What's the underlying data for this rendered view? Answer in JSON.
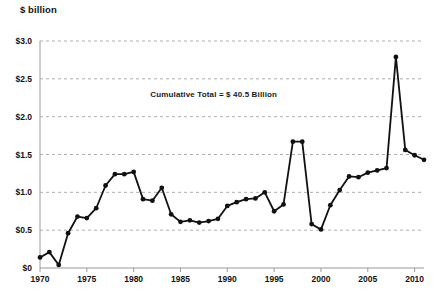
{
  "chart_data": {
    "type": "line",
    "title": "",
    "ylabel": "$ billion",
    "xlabel": "",
    "ylim": [
      0,
      3.0
    ],
    "xlim": [
      1970,
      2011
    ],
    "grid": true,
    "legend": "none",
    "y_ticks": [
      0,
      0.5,
      1.0,
      1.5,
      2.0,
      2.5,
      3.0
    ],
    "y_tick_labels": [
      "$0",
      "$0.5",
      "$1.0",
      "$1.5",
      "$2.0",
      "$2.5",
      "$3.0"
    ],
    "x_ticks": [
      1970,
      1975,
      1980,
      1985,
      1990,
      1995,
      2000,
      2005,
      2010
    ],
    "x_tick_labels": [
      "1970",
      "1975",
      "1980",
      "1985",
      "1990",
      "1995",
      "2000",
      "2005",
      "2010"
    ],
    "annotations": [
      {
        "text": "Cumulative Total = $ 40.5 Billion",
        "x": 1988.5,
        "y": 2.28
      }
    ],
    "series": [
      {
        "name": "Annual amount",
        "color": "#111111",
        "marker": "circle",
        "x": [
          1970,
          1971,
          1972,
          1973,
          1974,
          1975,
          1976,
          1977,
          1978,
          1979,
          1980,
          1981,
          1982,
          1983,
          1984,
          1985,
          1986,
          1987,
          1988,
          1989,
          1990,
          1991,
          1992,
          1993,
          1994,
          1995,
          1996,
          1997,
          1998,
          1999,
          2000,
          2001,
          2002,
          2003,
          2004,
          2005,
          2006,
          2007,
          2008,
          2009,
          2010,
          2011
        ],
        "values": [
          0.14,
          0.21,
          0.04,
          0.46,
          0.68,
          0.66,
          0.79,
          1.09,
          1.24,
          1.24,
          1.27,
          0.91,
          0.89,
          1.06,
          0.71,
          0.61,
          0.63,
          0.6,
          0.62,
          0.65,
          0.82,
          0.87,
          0.91,
          0.92,
          1.0,
          0.75,
          0.84,
          1.67,
          1.67,
          0.58,
          0.51,
          0.83,
          1.03,
          1.21,
          1.2,
          1.26,
          1.29,
          1.32,
          2.79,
          1.56,
          1.49,
          1.43
        ]
      }
    ]
  }
}
